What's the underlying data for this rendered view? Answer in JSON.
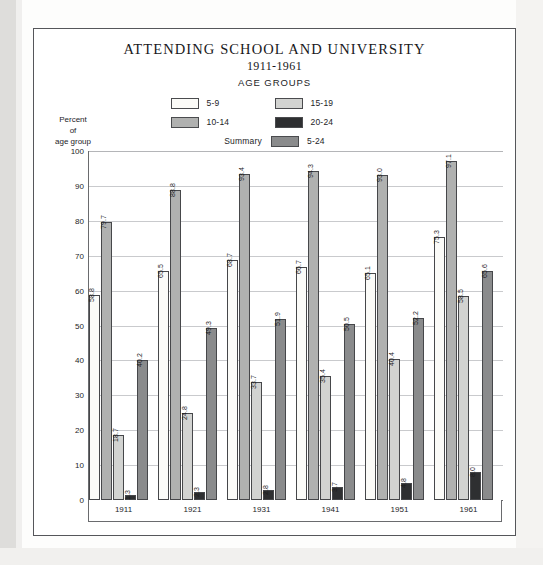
{
  "figure": {
    "title": "ATTENDING SCHOOL AND UNIVERSITY",
    "subtitle": "1911-1961",
    "legend_title": "AGE GROUPS",
    "summary_text": "Summary",
    "y_caption_line1": "Percent",
    "y_caption_line2": "of",
    "y_caption_line3": "age group"
  },
  "colors": {
    "series_5_9": "#fbfbf8",
    "series_10_14": "#b0b1b0",
    "series_15_19": "#d2d3d1",
    "series_20_24": "#2e2f31",
    "series_5_24": "#8a8b8c",
    "axis": "#6a6b6e",
    "grid": "#c9cacd",
    "text": "#1d1d1f",
    "frame": "#55565a"
  },
  "chart_data": {
    "type": "bar",
    "title": "ATTENDING SCHOOL AND UNIVERSITY 1911-1961",
    "xlabel": "",
    "ylabel": "Percent of age group",
    "ylim": [
      0,
      100
    ],
    "ytick_values": [
      100,
      90,
      80,
      70,
      60,
      50,
      40,
      30,
      20,
      10,
      0
    ],
    "ytick_labels": [
      "100",
      "90",
      "80",
      "70",
      "60",
      "50",
      "40",
      "30",
      "20",
      "10",
      "0"
    ],
    "grid": true,
    "legend_position": "top-center",
    "categories": [
      "1911",
      "1921",
      "1931",
      "1941",
      "1951",
      "1961"
    ],
    "series": [
      {
        "name": "5-9",
        "color": "#fbfbf8",
        "values": [
          58.8,
          65.5,
          68.7,
          66.7,
          65.1,
          75.3
        ],
        "labels": [
          "58.8",
          "65.5",
          "68.7",
          "66.7",
          "65.1",
          "75.3"
        ]
      },
      {
        "name": "10-14",
        "color": "#b0b1b0",
        "values": [
          79.7,
          88.8,
          93.4,
          94.3,
          93.0,
          97.1
        ],
        "labels": [
          "79.7",
          "88.8",
          "93.4",
          "94.3",
          "93.0",
          "97.1"
        ]
      },
      {
        "name": "15-19",
        "color": "#d2d3d1",
        "values": [
          18.7,
          24.8,
          33.7,
          35.4,
          40.4,
          58.5
        ],
        "labels": [
          "18.7",
          "24.8",
          "33.7",
          "35.4",
          "40.4",
          "58.5"
        ]
      },
      {
        "name": "20-24",
        "color": "#2e2f31",
        "values": [
          1.3,
          2.3,
          2.8,
          3.7,
          4.8,
          8.0
        ],
        "labels": [
          "1.3",
          "2.3",
          "2.8",
          "3.7",
          "4.8",
          "8.0"
        ]
      },
      {
        "name": "5-24",
        "color": "#8a8b8c",
        "values": [
          40.2,
          49.3,
          51.9,
          50.5,
          52.2,
          65.6
        ],
        "labels": [
          "40.2",
          "49.3",
          "51.9",
          "50.5",
          "52.2",
          "65.6"
        ]
      }
    ],
    "legend_entries": [
      {
        "label": "5-9",
        "color": "#fbfbf8"
      },
      {
        "label": "15-19",
        "color": "#d2d3d1"
      },
      {
        "label": "10-14",
        "color": "#b0b1b0"
      },
      {
        "label": "20-24",
        "color": "#2e2f31"
      },
      {
        "label": "5-24",
        "color": "#8a8b8c"
      }
    ]
  }
}
